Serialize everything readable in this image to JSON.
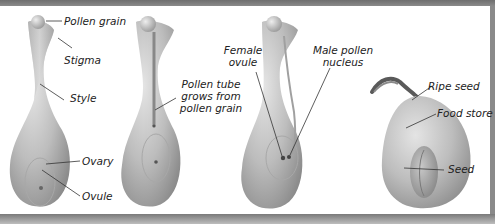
{
  "diagram": {
    "stages": [
      {
        "name": "flower-with-pollen",
        "labels": {
          "pollen_grain": "Pollen grain",
          "stigma": "Stigma",
          "style": "Style",
          "ovary": "Ovary",
          "ovule": "Ovule"
        }
      },
      {
        "name": "pollen-tube-growth",
        "labels": {
          "pollen_tube_line1": "Pollen tube",
          "pollen_tube_line2": "grows from",
          "pollen_tube_line3": "pollen grain"
        }
      },
      {
        "name": "fertilization",
        "labels": {
          "female_ovule_line1": "Female",
          "female_ovule_line2": "ovule",
          "male_nucleus_line1": "Male pollen",
          "male_nucleus_line2": "nucleus"
        }
      },
      {
        "name": "ripe-seed",
        "labels": {
          "ripe_seed": "Ripe seed",
          "food_store": "Food store",
          "seed": "Seed"
        }
      }
    ],
    "colors": {
      "body_light": "#d9d9d9",
      "body_mid": "#b8b8b8",
      "body_dark": "#8f8f8f",
      "frame": "#7a7a7a"
    }
  }
}
